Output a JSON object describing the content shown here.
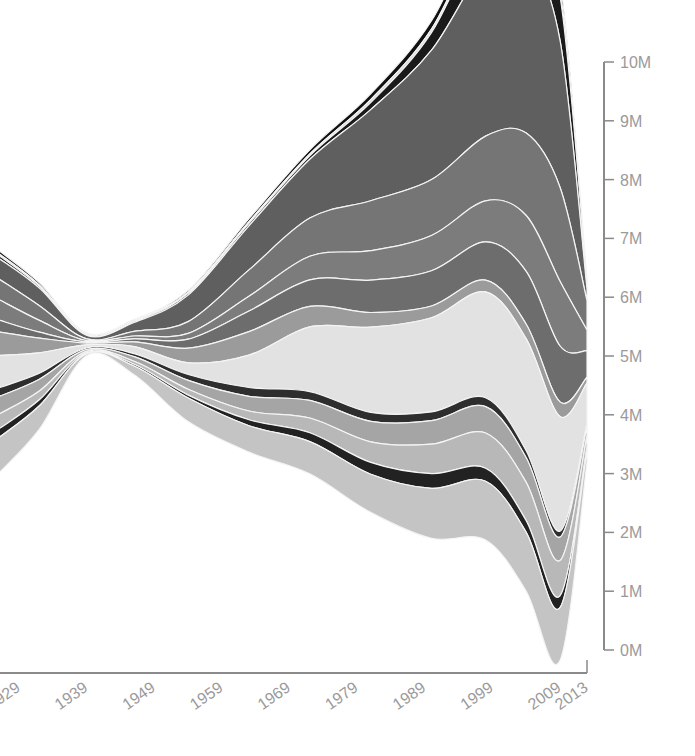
{
  "chart_data": {
    "type": "area",
    "subtype": "streamgraph",
    "title": "",
    "xlabel": "",
    "ylabel": "",
    "x_ticks": [
      "1929",
      "1939",
      "1949",
      "1959",
      "1969",
      "1979",
      "1989",
      "1999",
      "2009",
      "2013"
    ],
    "y_ticks": [
      "0M",
      "1M",
      "2M",
      "3M",
      "4M",
      "5M",
      "6M",
      "7M",
      "8M",
      "9M",
      "10M"
    ],
    "ylim": [
      0,
      10000000
    ],
    "xlim": [
      1926,
      2013
    ],
    "grid": false,
    "legend": null,
    "x": [
      1926,
      1932,
      1939,
      1946,
      1954,
      1963,
      1972,
      1981,
      1990,
      1998,
      2004,
      2009,
      2013
    ],
    "series": [
      {
        "name": "layer-1",
        "color": "#111111",
        "values": [
          0.05,
          0.04,
          0.02,
          0.02,
          0.03,
          0.05,
          0.07,
          0.1,
          0.14,
          0.18,
          0.2,
          0.2,
          0.05
        ]
      },
      {
        "name": "layer-2",
        "color": "#d8d8d8",
        "values": [
          0.03,
          0.02,
          0.01,
          0.01,
          0.02,
          0.03,
          0.03,
          0.05,
          0.06,
          0.06,
          0.06,
          0.06,
          0.02
        ]
      },
      {
        "name": "layer-3",
        "color": "#1a1a1a",
        "values": [
          0.05,
          0.03,
          0.01,
          0.02,
          0.03,
          0.04,
          0.06,
          0.12,
          0.3,
          0.65,
          0.75,
          0.75,
          0.1
        ]
      },
      {
        "name": "layer-4",
        "color": "#5f5f5f",
        "values": [
          0.35,
          0.3,
          0.06,
          0.15,
          0.45,
          0.75,
          1.0,
          1.55,
          2.2,
          2.9,
          3.0,
          2.5,
          0.2
        ]
      },
      {
        "name": "layer-5",
        "color": "#757575",
        "values": [
          0.35,
          0.25,
          0.03,
          0.08,
          0.2,
          0.45,
          0.65,
          0.85,
          0.95,
          1.1,
          1.4,
          1.6,
          0.5
        ]
      },
      {
        "name": "layer-6",
        "color": "#7c7c7c",
        "values": [
          0.35,
          0.2,
          0.02,
          0.05,
          0.1,
          0.25,
          0.4,
          0.5,
          0.6,
          0.7,
          0.95,
          1.1,
          0.35
        ]
      },
      {
        "name": "layer-7",
        "color": "#6d6d6d",
        "values": [
          0.2,
          0.1,
          0.02,
          0.05,
          0.15,
          0.35,
          0.45,
          0.55,
          0.6,
          0.65,
          0.9,
          0.95,
          0.45
        ]
      },
      {
        "name": "layer-8",
        "color": "#9b9b9b",
        "values": [
          0.4,
          0.25,
          0.03,
          0.08,
          0.25,
          0.4,
          0.35,
          0.25,
          0.2,
          0.2,
          0.25,
          0.25,
          0.1
        ]
      },
      {
        "name": "layer-9",
        "color": "#e2e2e2",
        "values": [
          0.55,
          0.35,
          0.05,
          0.12,
          0.2,
          0.55,
          1.1,
          1.45,
          1.6,
          1.8,
          1.9,
          1.95,
          0.7
        ]
      },
      {
        "name": "layer-10",
        "color": "#2e2e2e",
        "values": [
          0.15,
          0.1,
          0.03,
          0.05,
          0.1,
          0.15,
          0.15,
          0.15,
          0.15,
          0.15,
          0.12,
          0.1,
          0.05
        ]
      },
      {
        "name": "layer-11",
        "color": "#a5a5a5",
        "values": [
          0.3,
          0.2,
          0.03,
          0.08,
          0.15,
          0.25,
          0.3,
          0.35,
          0.4,
          0.45,
          0.42,
          0.4,
          0.15
        ]
      },
      {
        "name": "layer-12",
        "color": "#b8b8b8",
        "values": [
          0.25,
          0.15,
          0.02,
          0.05,
          0.1,
          0.15,
          0.25,
          0.35,
          0.5,
          0.6,
          0.65,
          0.6,
          0.2
        ]
      },
      {
        "name": "layer-13",
        "color": "#222222",
        "values": [
          0.15,
          0.1,
          0.02,
          0.03,
          0.05,
          0.1,
          0.15,
          0.2,
          0.25,
          0.22,
          0.2,
          0.2,
          0.05
        ]
      },
      {
        "name": "layer-14",
        "color": "#c4c4c4",
        "values": [
          0.6,
          0.4,
          0.03,
          0.15,
          0.4,
          0.45,
          0.55,
          0.65,
          0.85,
          1.0,
          1.0,
          0.9,
          0.2
        ]
      }
    ],
    "annotations": []
  }
}
